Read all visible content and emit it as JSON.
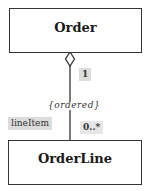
{
  "diagram": {
    "type": "uml-class-aggregation",
    "classes": [
      {
        "id": "order",
        "name": "Order"
      },
      {
        "id": "orderline",
        "name": "OrderLine"
      }
    ],
    "association": {
      "kind": "aggregation",
      "whole_end": {
        "class": "Order",
        "multiplicity": "1"
      },
      "part_end": {
        "class": "OrderLine",
        "role": "lineItem",
        "multiplicity": "0..*"
      },
      "constraint": "{ordered}"
    }
  },
  "colors": {
    "line": "#333333",
    "label_shading": "#dcdcdc",
    "background": "#ffffff"
  }
}
